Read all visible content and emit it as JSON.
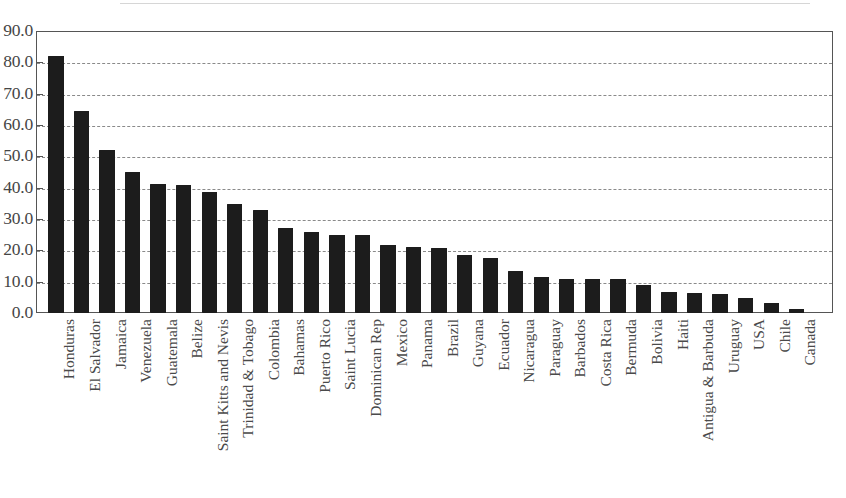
{
  "chart_data": {
    "type": "bar",
    "title": "",
    "subtitle": "",
    "xlabel": "",
    "ylabel": "",
    "ylim": [
      0,
      90
    ],
    "ytick_labels": [
      "0.0",
      "10.0",
      "20.0",
      "30.0",
      "40.0",
      "50.0",
      "60.0",
      "70.0",
      "80.0",
      "90.0"
    ],
    "ytick_values": [
      0,
      10,
      20,
      30,
      40,
      50,
      60,
      70,
      80,
      90
    ],
    "grid": "horizontal-dashed",
    "legend": "none",
    "bar_color": "#1c1c1c",
    "grid_color": "#8a8a8a",
    "axis_color": "#555555",
    "categories": [
      "Honduras",
      "El Salvador",
      "Jamaica",
      "Venezuela",
      "Guatemala",
      "Belize",
      "Saint Kitts and Nevis",
      "Trinidad & Tobago",
      "Colombia",
      "Bahamas",
      "Puerto Rico",
      "Saint Lucia",
      "Dominican Rep",
      "Mexico",
      "Panama",
      "Brazil",
      "Guyana",
      "Ecuador",
      "Nicaragua",
      "Paraguay",
      "Barbados",
      "Costa Rica",
      "Bermuda",
      "Bolivia",
      "Haiti",
      "Antigua & Barbuda",
      "Uruguay",
      "USA",
      "Chile",
      "Canada"
    ],
    "values": [
      82.0,
      64.5,
      52.0,
      45.0,
      41.2,
      41.0,
      38.5,
      34.8,
      33.0,
      27.0,
      26.0,
      25.0,
      25.0,
      21.8,
      21.0,
      20.7,
      18.5,
      17.7,
      13.3,
      11.5,
      11.0,
      11.0,
      10.8,
      8.8,
      6.8,
      6.5,
      6.2,
      4.8,
      3.2,
      1.2
    ]
  }
}
